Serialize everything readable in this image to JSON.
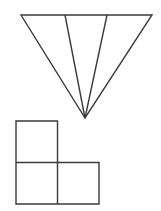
{
  "figure": {
    "title": "Subdivided inverted triangle and L-shaped tromino",
    "canvas": {
      "width": 161,
      "height": 211,
      "background_color": "#ffffff"
    },
    "style": {
      "stroke_color": "#3a3a3a",
      "fill_color": "none",
      "stroke_width": 1.4
    },
    "shapes": [
      {
        "id": "inverted-triangle",
        "name": "Inverted triangle partitioned into three sub-triangles",
        "type": "triangle",
        "orientation": "apex-down",
        "vertices": [
          {
            "label": "top-left",
            "x": 21,
            "y": 15
          },
          {
            "label": "top-right",
            "x": 152,
            "y": 15
          },
          {
            "label": "apex",
            "x": 85,
            "y": 118
          }
        ],
        "top_edge": {
          "x1": 21,
          "y1": 15,
          "x2": 152,
          "y2": 15,
          "length": 131
        },
        "height": 103,
        "divider_count": 2,
        "region_count": 3,
        "dividers": [
          {
            "id": "divider-1",
            "from_x": 65,
            "from_y": 15,
            "to_x": 85,
            "to_y": 118
          },
          {
            "id": "divider-2",
            "from_x": 107,
            "from_y": 15,
            "to_x": 85,
            "to_y": 118
          }
        ],
        "regions": [
          {
            "id": "region-left",
            "top_span_x": [
              21,
              65
            ]
          },
          {
            "id": "region-middle",
            "top_span_x": [
              65,
              107
            ]
          },
          {
            "id": "region-right",
            "top_span_x": [
              107,
              152
            ]
          }
        ]
      },
      {
        "id": "l-tromino",
        "name": "L-shaped tromino made of three unit squares",
        "type": "polyomino",
        "cell_size": 41.5,
        "origin": {
          "x": 16,
          "y": 121
        },
        "bounds": {
          "left": 16,
          "top": 121,
          "right": 99,
          "bottom": 204
        },
        "cells": [
          {
            "id": "cell-top-left",
            "col": 0,
            "row": 0,
            "x": 16,
            "y": 121,
            "w": 41.5,
            "h": 41.5
          },
          {
            "id": "cell-bottom-left",
            "col": 0,
            "row": 1,
            "x": 16,
            "y": 162.5,
            "w": 41.5,
            "h": 41.5
          },
          {
            "id": "cell-bottom-right",
            "col": 1,
            "row": 1,
            "x": 57.5,
            "y": 162.5,
            "w": 41.5,
            "h": 41.5
          }
        ],
        "outline_path": "M16,121 L57.5,121 L57.5,162.5 L99,162.5 L99,204 L16,204 Z",
        "internal_edges": [
          {
            "id": "edge-horizontal-mid",
            "x1": 16,
            "y1": 162.5,
            "x2": 57.5,
            "y2": 162.5
          },
          {
            "id": "edge-vertical-mid",
            "x1": 57.5,
            "y1": 162.5,
            "x2": 57.5,
            "y2": 204
          }
        ]
      }
    ]
  }
}
